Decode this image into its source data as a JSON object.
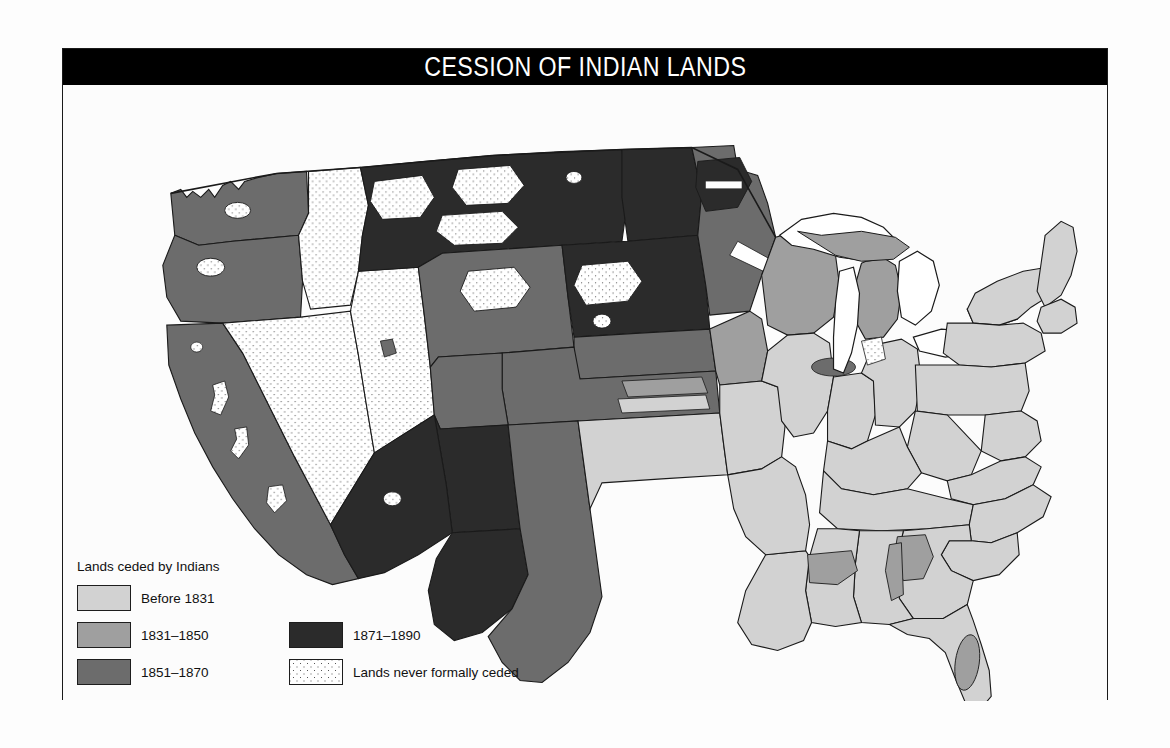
{
  "figure": {
    "title": "CESSION OF INDIAN LANDS"
  },
  "legend": {
    "title": "Lands ceded by Indians",
    "entries": [
      {
        "label": "Before 1831",
        "color": "#d2d2d2",
        "pattern": "solid"
      },
      {
        "label": "1831–1850",
        "color": "#9f9f9f",
        "pattern": "solid"
      },
      {
        "label": "1851–1870",
        "color": "#6c6c6c",
        "pattern": "solid"
      },
      {
        "label": "1871–1890",
        "color": "#2b2b2b",
        "pattern": "solid"
      },
      {
        "label": "Lands never formally ceded",
        "color": "#ffffff",
        "pattern": "stipple"
      }
    ]
  },
  "map_data": {
    "type": "choropleth",
    "subject": "United States",
    "projection": "conic",
    "classes": [
      {
        "key": "before_1831",
        "label": "Before 1831",
        "fill": "#d2d2d2"
      },
      {
        "key": "c1831_1850",
        "label": "1831–1850",
        "fill": "#9f9f9f"
      },
      {
        "key": "c1851_1870",
        "label": "1851–1870",
        "fill": "#6c6c6c"
      },
      {
        "key": "c1871_1890",
        "label": "1871–1890",
        "fill": "#2b2b2b"
      },
      {
        "key": "never_ceded",
        "label": "Lands never formally ceded",
        "fill": "#ffffff"
      }
    ],
    "water_fill": "#ffffff",
    "border_color": "#1a1a1a",
    "regions": [
      {
        "name": "Pacific Northwest coast",
        "class": "c1851_1870"
      },
      {
        "name": "Northern Rockies",
        "class": "c1871_1890"
      },
      {
        "name": "Great Basin",
        "class": "never_ceded"
      },
      {
        "name": "California",
        "class": "c1851_1870"
      },
      {
        "name": "Southwest deserts",
        "class": "c1871_1890"
      },
      {
        "name": "Northern Great Plains",
        "class": "c1871_1890"
      },
      {
        "name": "Central Great Plains",
        "class": "c1851_1870"
      },
      {
        "name": "Upper Midwest",
        "class": "c1831_1850"
      },
      {
        "name": "Old Northwest",
        "class": "before_1831"
      },
      {
        "name": "Atlantic seaboard",
        "class": "before_1831"
      },
      {
        "name": "Southeast",
        "class": "before_1831"
      },
      {
        "name": "Seminole Florida",
        "class": "c1831_1850"
      },
      {
        "name": "Great Lakes",
        "class": "water"
      }
    ]
  }
}
